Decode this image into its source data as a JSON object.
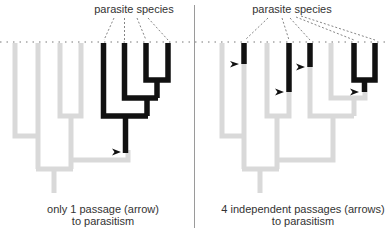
{
  "colors": {
    "ancestral": "#d9d9d9",
    "parasitic": "#111111",
    "divider": "#9a9a9a",
    "dotted": "#777777",
    "text": "#333333"
  },
  "left_panel": {
    "header": "parasite species",
    "caption_line1": "only 1 passage (arrow)",
    "caption_line2": "to parasitism",
    "arrow_count": 1,
    "parasite_tips": 4,
    "free_living_tips": 4
  },
  "right_panel": {
    "header": "parasite species",
    "caption_line1": "4 independent passages (arrows)",
    "caption_line2": "to parasitism",
    "arrow_count": 4,
    "parasite_tips": 5,
    "free_living_tips": 4
  }
}
